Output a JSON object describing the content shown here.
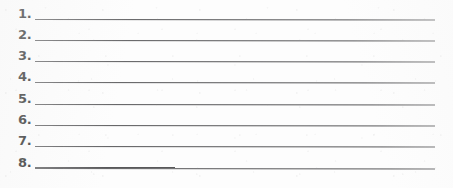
{
  "document": {
    "type": "scanned-worksheet",
    "page_background_color": "#fdfdfd",
    "ink_color": "#151515",
    "rule_color": "#58585a",
    "item_count": 8
  },
  "list": {
    "name": "numbered-answer-lines",
    "items": [
      {
        "number": "1.",
        "answer_text": ""
      },
      {
        "number": "2.",
        "answer_text": ""
      },
      {
        "number": "3.",
        "answer_text": ""
      },
      {
        "number": "4.",
        "answer_text": ""
      },
      {
        "number": "5.",
        "answer_text": ""
      },
      {
        "number": "6.",
        "answer_text": ""
      },
      {
        "number": "7.",
        "answer_text": ""
      },
      {
        "number": "8.",
        "answer_text": ""
      }
    ]
  }
}
